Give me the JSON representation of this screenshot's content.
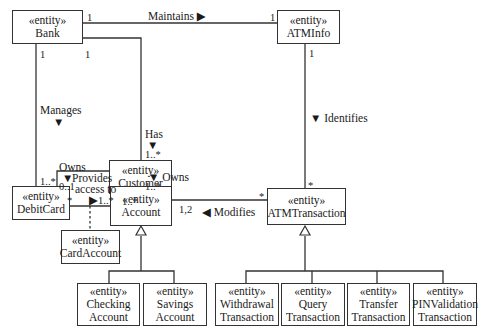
{
  "diagram": {
    "type": "UML class diagram",
    "stereotype": "«entity»",
    "classes": {
      "bank": {
        "stereotype": "«entity»",
        "name": "Bank"
      },
      "atminfo": {
        "stereotype": "«entity»",
        "name": "ATMInfo"
      },
      "customer": {
        "stereotype": "«entity»",
        "name": "Customer"
      },
      "debitcard": {
        "stereotype": "«entity»",
        "name": "DebitCard"
      },
      "account": {
        "stereotype": "«entity»",
        "name": "Account"
      },
      "cardaccount": {
        "stereotype": "«entity»",
        "name": "CardAccount"
      },
      "atmtransaction": {
        "stereotype": "«entity»",
        "name": "ATMTransaction"
      },
      "checking": {
        "stereotype": "«entity»",
        "name1": "Checking",
        "name2": "Account"
      },
      "savings": {
        "stereotype": "«entity»",
        "name1": "Savings",
        "name2": "Account"
      },
      "withdrawal": {
        "stereotype": "«entity»",
        "name1": "Withdrawal",
        "name2": "Transaction"
      },
      "query": {
        "stereotype": "«entity»",
        "name1": "Query",
        "name2": "Transaction"
      },
      "transfer": {
        "stereotype": "«entity»",
        "name1": "Transfer",
        "name2": "Transaction"
      },
      "pinvalidation": {
        "stereotype": "«entity»",
        "name1": "PINValidation",
        "name2": "Transaction"
      }
    },
    "associations": {
      "maintains": {
        "label": "Maintains ▶",
        "from": "Bank",
        "to": "ATMInfo",
        "mult_from": "1",
        "mult_to": "1"
      },
      "manages": {
        "label": "Manages",
        "arrow": "▼",
        "from": "Bank",
        "to": "DebitCard",
        "mult_from": "1",
        "mult_to": "1..*"
      },
      "has": {
        "label": "Has",
        "arrow": "▼",
        "from": "Bank",
        "to": "Customer",
        "mult_from": "1",
        "mult_to": "1..*"
      },
      "identifies": {
        "label": "▼ Identifies",
        "from": "ATMInfo",
        "to": "ATMTransaction",
        "mult_from": "1",
        "mult_to": "*"
      },
      "owns_card": {
        "label": "Owns",
        "arrow": "▼",
        "from": "Customer",
        "to": "DebitCard",
        "mult_from": "1..*",
        "mult_to": "0..1"
      },
      "owns_account": {
        "label": "▼ Owns",
        "from": "Customer",
        "to": "Account",
        "mult_from": "1..*",
        "mult_to": "1..*"
      },
      "provides_access": {
        "label1": "Provides",
        "label2": "access to",
        "arrow": "▶",
        "from": "DebitCard",
        "to": "Account",
        "mult_from": "*",
        "mult_to": "1..*"
      },
      "modifies": {
        "label": "◀ Modifies",
        "from": "ATMTransaction",
        "to": "Account",
        "mult_from": "*",
        "mult_to": "1,2"
      }
    }
  }
}
